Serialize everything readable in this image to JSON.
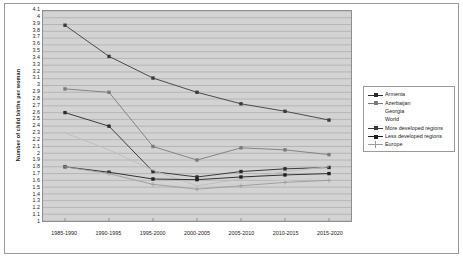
{
  "chart_data": {
    "type": "line",
    "title": "",
    "xlabel": "",
    "ylabel": "Number of child births per woman",
    "categories": [
      "1985-1990",
      "1990-1995",
      "1995-2000",
      "2000-2005",
      "2005-2010",
      "2010-2015",
      "2015-2020"
    ],
    "ylim": [
      1,
      4.1
    ],
    "ytick_step": 0.1,
    "yticks": [
      "4.1",
      "4",
      "3.9",
      "3.8",
      "3.7",
      "3.6",
      "3.5",
      "3.4",
      "3.3",
      "3.2",
      "3.1",
      "3",
      "2.9",
      "2.8",
      "2.7",
      "2.6",
      "2.5",
      "2.4",
      "2.3",
      "2.2",
      "2.1",
      "2",
      "1.9",
      "1.8",
      "1.7",
      "1.6",
      "1.5",
      "1.4",
      "1.3",
      "1.2",
      "1.1",
      "1"
    ],
    "grid": true,
    "grid_axis": "y",
    "legend_position": "right",
    "plot_background": "#d3d3d3",
    "series": [
      {
        "name": "Armenia",
        "color": "#2b2b2b",
        "marker": "square",
        "values": [
          2.6,
          2.4,
          1.73,
          1.65,
          1.73,
          1.77,
          1.79
        ]
      },
      {
        "name": "Azerbaijan",
        "color": "#7a7a7a",
        "marker": "square",
        "values": [
          2.95,
          2.9,
          2.1,
          1.9,
          2.08,
          2.05,
          1.98
        ]
      },
      {
        "name": "Georgia",
        "color": "#bdbdbd",
        "marker": "none",
        "values": [
          2.3,
          2.05,
          1.75,
          1.52,
          1.62,
          1.73,
          1.8
        ]
      },
      {
        "name": "World",
        "color": "#cfcfcf",
        "marker": "none",
        "values": [
          1.8,
          1.68,
          1.55,
          1.5,
          1.55,
          1.6,
          1.65
        ]
      },
      {
        "name": "More developed regions",
        "color": "#3a3a3a",
        "marker": "square",
        "values": [
          3.89,
          3.43,
          3.11,
          2.9,
          2.73,
          2.62,
          2.49
        ]
      },
      {
        "name": "Less developed regions",
        "color": "#1f1f1f",
        "marker": "square",
        "values": [
          1.8,
          1.72,
          1.62,
          1.61,
          1.65,
          1.68,
          1.7
        ]
      },
      {
        "name": "Europe",
        "color": "#9a9a9a",
        "marker": "plus",
        "values": [
          1.8,
          1.7,
          1.54,
          1.47,
          1.52,
          1.57,
          1.6
        ]
      }
    ]
  },
  "legend": {
    "items": [
      {
        "label": "Armenia"
      },
      {
        "label": "Azerbaijan"
      },
      {
        "label": "Georgia"
      },
      {
        "label": "World"
      },
      {
        "label": "More developed regions"
      },
      {
        "label": "Less developed regions"
      },
      {
        "label": "Europe"
      }
    ]
  }
}
